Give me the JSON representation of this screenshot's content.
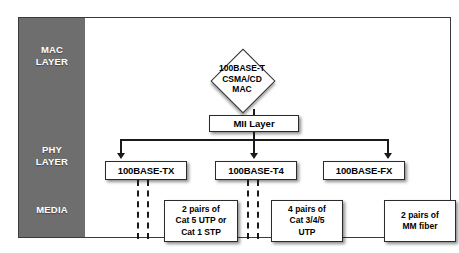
{
  "diagram": {
    "layers": [
      {
        "id": "mac",
        "label_line1": "MAC",
        "label_line2": "LAYER"
      },
      {
        "id": "phy",
        "label_line1": "PHY",
        "label_line2": "LAYER"
      },
      {
        "id": "media",
        "label_line1": "MEDIA",
        "label_line2": ""
      }
    ],
    "mac_block": {
      "line1": "100BASE-T",
      "line2": "CSMA/CD",
      "line3": "MAC",
      "shape": "diamond"
    },
    "mii": {
      "label": "MII Layer"
    },
    "phy_blocks": [
      {
        "id": "tx",
        "label": "100BASE-TX"
      },
      {
        "id": "t4",
        "label": "100BASE-T4"
      },
      {
        "id": "fx",
        "label": "100BASE-FX"
      }
    ],
    "media_blocks": [
      {
        "id": "media-tx",
        "line1": "2 pairs of",
        "line2": "Cat 5 UTP or",
        "line3": "Cat 1 STP",
        "connector": "dashed-pair"
      },
      {
        "id": "media-t4",
        "line1": "4 pairs of",
        "line2": "Cat 3/4/5",
        "line3": "UTP",
        "connector": "dashed-pair"
      },
      {
        "id": "media-fx",
        "line1": "2 pairs of",
        "line2": "MM fiber",
        "line3": "",
        "connector": "solid-single"
      }
    ],
    "colors": {
      "band_gray": "#6e6e6e",
      "band_text": "#ffffff",
      "box_fill": "#ffffff",
      "box_border": "#2b2b2b",
      "line": "#1a1a1a",
      "frame": "#3a3a3a",
      "background": "#ffffff"
    }
  }
}
